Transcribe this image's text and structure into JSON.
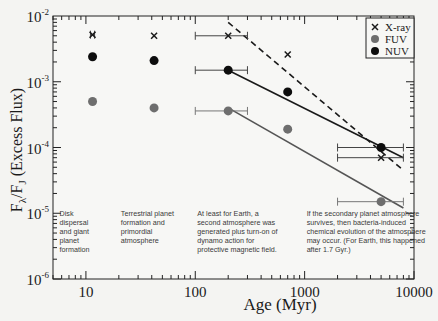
{
  "chart_data": {
    "type": "scatter",
    "title": "",
    "xlabel": "Age (Myr)",
    "ylabel": "Fλ/FJ (Excess Flux)",
    "xscale": "log",
    "yscale": "log",
    "xlim": [
      5,
      10000
    ],
    "ylim": [
      1e-06,
      0.01
    ],
    "grid": false,
    "legend_position": "top-right",
    "x_ticks": [
      {
        "value": 10,
        "label": "10"
      },
      {
        "value": 100,
        "label": "100"
      },
      {
        "value": 1000,
        "label": "1000"
      },
      {
        "value": 10000,
        "label": "10000"
      }
    ],
    "y_ticks": [
      {
        "value": 0.01,
        "base": "10",
        "exp": "-2"
      },
      {
        "value": 0.001,
        "base": "10",
        "exp": "-3"
      },
      {
        "value": 0.0001,
        "base": "10",
        "exp": "-4"
      },
      {
        "value": 1e-05,
        "base": "10",
        "exp": "-5"
      },
      {
        "value": 1e-06,
        "base": "10",
        "exp": "-6"
      }
    ],
    "series": [
      {
        "name": "X-ray",
        "marker": "x",
        "color": "#1a1a1a",
        "points": [
          {
            "x": 11.5,
            "y": 0.0052,
            "xerr": [
              11,
              12
            ]
          },
          {
            "x": 42,
            "y": 0.005
          },
          {
            "x": 200,
            "y": 0.005,
            "xerr": [
              100,
              300
            ]
          },
          {
            "x": 700,
            "y": 0.0026
          },
          {
            "x": 5000,
            "y": 7e-05,
            "xerr": [
              2000,
              8000
            ]
          }
        ]
      },
      {
        "name": "FUV",
        "marker": "circle",
        "color": "#6e6e6e",
        "points": [
          {
            "x": 11.5,
            "y": 0.0005
          },
          {
            "x": 42,
            "y": 0.0004
          },
          {
            "x": 200,
            "y": 0.00036,
            "xerr": [
              100,
              300
            ]
          },
          {
            "x": 700,
            "y": 0.00019
          },
          {
            "x": 5000,
            "y": 1.5e-05,
            "xerr": [
              2000,
              8000
            ]
          }
        ]
      },
      {
        "name": "NUV",
        "marker": "circle",
        "color": "#0d0d0d",
        "points": [
          {
            "x": 11.5,
            "y": 0.0024
          },
          {
            "x": 42,
            "y": 0.0021
          },
          {
            "x": 200,
            "y": 0.0015,
            "xerr": [
              100,
              300
            ]
          },
          {
            "x": 700,
            "y": 0.0007
          },
          {
            "x": 5000,
            "y": 0.0001,
            "xerr": [
              2000,
              8000
            ]
          }
        ]
      }
    ],
    "fit_lines": [
      {
        "name": "X-ray fit",
        "style": "dashed",
        "color": "#1a1a1a",
        "from": [
          200,
          0.008
        ],
        "to": [
          8000,
          4.5e-05
        ]
      },
      {
        "name": "NUV fit",
        "style": "solid",
        "color": "#1a1a1a",
        "from": [
          200,
          0.0015
        ],
        "to": [
          8000,
          7e-05
        ]
      },
      {
        "name": "FUV fit",
        "style": "solid",
        "color": "#555555",
        "from": [
          200,
          0.0004
        ],
        "to": [
          8000,
          1.2e-05
        ]
      }
    ],
    "annotations": [
      {
        "x": 5.5,
        "y": 1e-05,
        "lines": [
          "Disk",
          "dispersal",
          "and giant",
          "planet",
          "formation"
        ]
      },
      {
        "x": 20,
        "y": 1e-05,
        "lines": [
          "Terrestrial planet",
          "formation and",
          "primordial",
          "atmosphere"
        ]
      },
      {
        "x": 100,
        "y": 1e-05,
        "lines": [
          "At least for Earth, a",
          "second atmosphere was",
          "generated plus turn-on of",
          "dynamo action for",
          "protective magnetic field."
        ]
      },
      {
        "x": 1000,
        "y": 1e-05,
        "lines": [
          "If the secondary planet atmosphere",
          "survives, then bacteria-induced",
          "chemical evolution of the atmosphere",
          "may occur. (For Earth, this happened",
          "after 1.7 Gyr.)"
        ]
      }
    ]
  }
}
